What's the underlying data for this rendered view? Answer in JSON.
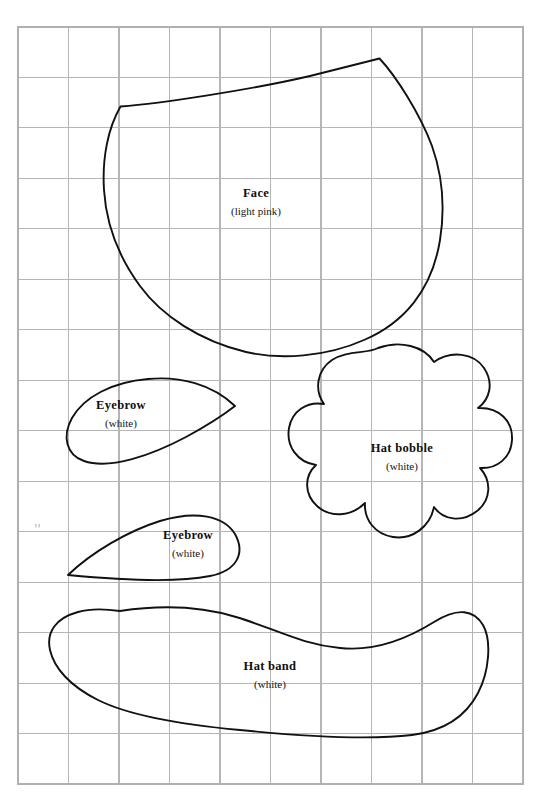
{
  "document": {
    "type": "sewing-pattern-template",
    "title": "Pattern pieces on grid",
    "background_color": "#ffffff",
    "page_width": 542,
    "page_height": 798
  },
  "grid": {
    "line_color": "#b5b5b5",
    "border_color": "#b0b0b0",
    "columns": 10,
    "rows": 15,
    "cell_size": 50.5,
    "origin_x": 18,
    "origin_y": 27,
    "width": 505,
    "height": 757
  },
  "pieces": [
    {
      "id": "face",
      "name": "Face",
      "material_note": "(light pink)",
      "label_x": 256,
      "label_y": 197,
      "sub_y": 215,
      "outline_color": "#111111",
      "path": "M 120.5 106.5 C 160 103.5 250 90 310 76 C 342 68 366 62 379.5 58.5 C 396 76 420 114 432 146 C 444 180 444.5 212 440 240 C 432 290 404 323 364 340 C 326 357 280 360 246 352 C 200 341 162 316 140 286 C 118 256 106 222 104 190 C 102 158 108 128 120.5 106.5 Z"
    },
    {
      "id": "eyebrow-left",
      "name": "Eyebrow",
      "material_note": "(white)",
      "label_x": 121,
      "label_y": 409,
      "sub_y": 427,
      "outline_color": "#111111",
      "path": "M 235 406 C 212 384 180 376 148 379 C 112 382 84 397 72 418 C 62 436 66 455 84 461 C 110 470 152 455 186 437 C 210 424 226 413 235 406 Z"
    },
    {
      "id": "eyebrow-right",
      "name": "Eyebrow",
      "material_note": "(white)",
      "label_x": 188,
      "label_y": 539,
      "sub_y": 557,
      "outline_color": "#111111",
      "path": "M 68 575 C 92 552 128 531 160 521 C 196 510 224 516 235 534 C 246 554 236 571 210 576 C 176 583 120 580 68 575 Z"
    },
    {
      "id": "hat-bobble",
      "name": "Hat bobble",
      "material_note": "(white)",
      "label_x": 402,
      "label_y": 452,
      "sub_y": 470,
      "outline_color": "#111111",
      "path": "M 378 348 C 400 340 424 346 434 362 C 451 350 474 353 484 368 C 494 383 490 399 478 408 C 499 407 513 421 512 440 C 511 458 497 469 480 468 C 492 481 491 500 477 511 C 462 523 443 520 434 507 C 430 527 412 540 393 537 C 375 534 364 520 365 503 C 351 517 330 518 317 506 C 304 494 304 476 316 465 C 297 462 286 446 289 428 C 292 411 307 401 324 404 C 314 390 317 370 332 360 C 347 350 367 354 378 348 Z"
    },
    {
      "id": "hat-band",
      "name": "Hat band",
      "material_note": "(white)",
      "label_x": 270,
      "label_y": 670,
      "sub_y": 688,
      "outline_color": "#111111",
      "path": "M 120 611 C 160 605 200 606 236 617 C 276 629 300 644 340 648 C 378 652 410 637 434 622 C 458 607 474 610 483 625 C 492 641 489 672 478 693 C 466 716 444 731 412 735 C 370 740 300 736 240 730 C 186 725 130 716 98 700 C 70 686 54 668 50 650 C 46 632 56 618 78 612 C 92 608 106 609 120 611 Z"
    }
  ],
  "artifacts": [
    {
      "id": "speck",
      "x": 35,
      "y": 524
    }
  ]
}
